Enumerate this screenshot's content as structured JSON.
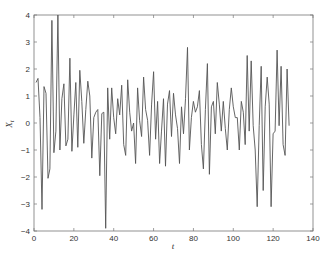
{
  "chart_data": {
    "type": "line",
    "title": "",
    "xlabel": "t",
    "ylabel": "X_t",
    "xlim": [
      0,
      140
    ],
    "ylim": [
      -4,
      4
    ],
    "xticks": [
      0,
      20,
      40,
      60,
      80,
      100,
      120,
      140
    ],
    "yticks": [
      -4,
      -3,
      -2,
      -1,
      0,
      1,
      2,
      3,
      4
    ],
    "grid": false,
    "legend": null,
    "line_color": "#555555",
    "series": [
      {
        "name": "X_t",
        "x": [
          1,
          2,
          3,
          4,
          5,
          6,
          7,
          8,
          9,
          10,
          11,
          12,
          13,
          14,
          15,
          16,
          17,
          18,
          19,
          20,
          21,
          22,
          23,
          24,
          25,
          26,
          27,
          28,
          29,
          30,
          31,
          32,
          33,
          34,
          35,
          36,
          37,
          38,
          39,
          40,
          41,
          42,
          43,
          44,
          45,
          46,
          47,
          48,
          49,
          50,
          51,
          52,
          53,
          54,
          55,
          56,
          57,
          58,
          59,
          60,
          61,
          62,
          63,
          64,
          65,
          66,
          67,
          68,
          69,
          70,
          71,
          72,
          73,
          74,
          75,
          76,
          77,
          78,
          79,
          80,
          81,
          82,
          83,
          84,
          85,
          86,
          87,
          88,
          89,
          90,
          91,
          92,
          93,
          94,
          95,
          96,
          97,
          98,
          99,
          100,
          101,
          102,
          103,
          104,
          105,
          106,
          107,
          108,
          109,
          110,
          111,
          112,
          113,
          114,
          115,
          116,
          117,
          118,
          119,
          120,
          121,
          122,
          123,
          124,
          125,
          126,
          127,
          128
        ],
        "values": [
          1.5,
          1.65,
          0.2,
          -3.2,
          1.35,
          1.1,
          -2.05,
          -1.7,
          3.8,
          -1.1,
          -0.3,
          4.0,
          -1.0,
          0.9,
          1.45,
          -0.85,
          -0.6,
          2.4,
          -1.05,
          0.3,
          1.5,
          -0.9,
          1.95,
          0.8,
          -0.75,
          0.5,
          1.55,
          1.0,
          -1.3,
          0.2,
          0.4,
          0.5,
          -1.95,
          0.35,
          0.4,
          -3.9,
          1.3,
          -0.6,
          1.3,
          0.2,
          -0.4,
          0.9,
          0.3,
          1.4,
          -0.8,
          -1.2,
          1.6,
          0.4,
          -0.3,
          0.0,
          -1.5,
          1.3,
          0.1,
          -0.5,
          1.7,
          0.5,
          0.1,
          -1.2,
          0.7,
          1.9,
          -0.6,
          0.8,
          -1.5,
          -0.3,
          0.9,
          -1.6,
          0.7,
          1.2,
          -0.5,
          1.1,
          0.3,
          -0.2,
          -1.5,
          0.6,
          -0.4,
          0.9,
          2.8,
          -1.0,
          0.2,
          0.8,
          0.4,
          0.6,
          1.2,
          -0.8,
          -1.7,
          0.5,
          2.2,
          -1.9,
          0.6,
          0.8,
          -0.4,
          1.5,
          0.7,
          -0.3,
          0.8,
          -0.2,
          -1.0,
          0.5,
          1.3,
          0.6,
          0.2,
          0.2,
          -1.0,
          0.8,
          0.4,
          -0.8,
          2.5,
          -0.3,
          2.3,
          -0.1,
          -1.0,
          -3.1,
          -0.1,
          2.1,
          -2.5,
          0.6,
          1.7,
          0.7,
          -3.1,
          -0.4,
          -0.3,
          2.7,
          -0.1,
          2.1,
          -0.8,
          -1.2,
          2.0,
          -0.1
        ]
      }
    ]
  },
  "axes": {
    "x_label": "t",
    "y_label_main": "X",
    "y_label_sub": "t"
  },
  "caption": ""
}
